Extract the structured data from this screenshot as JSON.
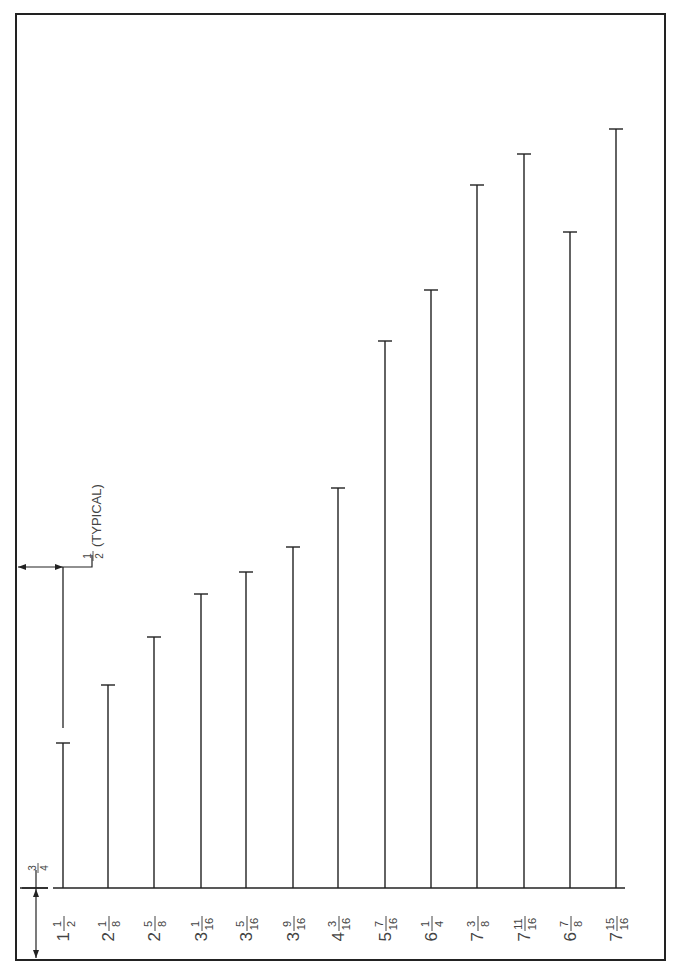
{
  "drawing": {
    "colors": {
      "ink": "#222222",
      "label": "#444444",
      "paper": "#ffffff"
    },
    "frame": {
      "left": 16,
      "top": 14,
      "right": 665,
      "bottom": 960
    },
    "baseline_y": 888,
    "annotations": {
      "offset_label": "3/4",
      "spacing_label_fraction": "1/2",
      "spacing_label_suffix": "(TYPICAL)"
    }
  },
  "chart_data": {
    "type": "bar",
    "title": "",
    "xlabel": "",
    "ylabel": "",
    "orientation": "vertical lines (rotated drawing)",
    "categories": [
      "1 1/2",
      "2 1/8",
      "2 5/8",
      "3 1/16",
      "3 5/16",
      "3 9/16",
      "4 3/16",
      "5 7/16",
      "6 1/4",
      "7 3/8",
      "7 11/16",
      "6 7/8",
      "7 15/16"
    ],
    "values": [
      1.5,
      2.125,
      2.625,
      3.0625,
      3.3125,
      3.5625,
      4.1875,
      5.4375,
      6.25,
      7.375,
      7.6875,
      6.875,
      7.9375
    ],
    "bars": [
      {
        "label_whole": "1",
        "label_num": "1",
        "label_den": "2",
        "x": 63,
        "top": 743
      },
      {
        "label_whole": "2",
        "label_num": "1",
        "label_den": "8",
        "x": 108,
        "top": 685
      },
      {
        "label_whole": "2",
        "label_num": "5",
        "label_den": "8",
        "x": 154,
        "top": 637
      },
      {
        "label_whole": "3",
        "label_num": "1",
        "label_den": "16",
        "x": 201,
        "top": 594
      },
      {
        "label_whole": "3",
        "label_num": "5",
        "label_den": "16",
        "x": 246,
        "top": 572
      },
      {
        "label_whole": "3",
        "label_num": "9",
        "label_den": "16",
        "x": 293,
        "top": 547
      },
      {
        "label_whole": "4",
        "label_num": "3",
        "label_den": "16",
        "x": 338,
        "top": 488
      },
      {
        "label_whole": "5",
        "label_num": "7",
        "label_den": "16",
        "x": 385,
        "top": 341
      },
      {
        "label_whole": "6",
        "label_num": "1",
        "label_den": "4",
        "x": 431,
        "top": 290
      },
      {
        "label_whole": "7",
        "label_num": "3",
        "label_den": "8",
        "x": 477,
        "top": 185
      },
      {
        "label_whole": "7",
        "label_num": "11",
        "label_den": "16",
        "x": 524,
        "top": 154
      },
      {
        "label_whole": "6",
        "label_num": "7",
        "label_den": "8",
        "x": 570,
        "top": 232
      },
      {
        "label_whole": "7",
        "label_num": "15",
        "label_den": "16",
        "x": 616,
        "top": 129
      }
    ],
    "annotations": [
      "3/4 offset from frame to baseline",
      "1/2 (TYPICAL) spacing from frame to first line"
    ],
    "units": "inches"
  }
}
